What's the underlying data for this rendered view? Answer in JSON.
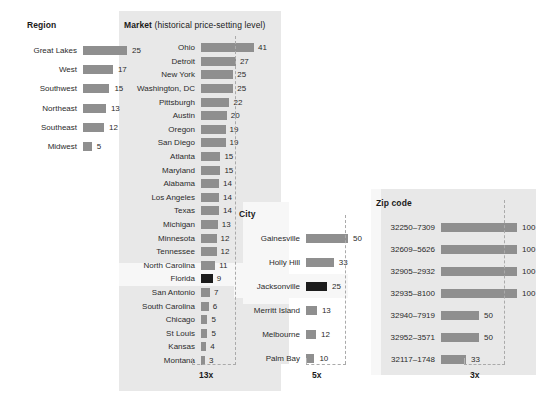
{
  "chart_data": {
    "type": "bar",
    "panels": [
      {
        "name": "region",
        "title": "Region",
        "title_sub": "",
        "max_value": 25,
        "categories": [
          "Great Lakes",
          "West",
          "Southwest",
          "Northeast",
          "Southeast",
          "Midwest"
        ],
        "values": [
          25,
          17,
          15,
          13,
          12,
          5
        ],
        "highlight": null,
        "multiplier": ""
      },
      {
        "name": "market",
        "title": "Market",
        "title_sub": " (historical price-setting level)",
        "max_value": 41,
        "categories": [
          "Ohio",
          "Detroit",
          "New York",
          "Washington, DC",
          "Pittsburgh",
          "Austin",
          "Oregon",
          "San Diego",
          "Atlanta",
          "Maryland",
          "Alabama",
          "Los Angeles",
          "Texas",
          "Michigan",
          "Minnesota",
          "Tennessee",
          "North Carolina",
          "Florida",
          "San Antonio",
          "South Carolina",
          "Chicago",
          "St Louis",
          "Kansas",
          "Montana"
        ],
        "values": [
          41,
          27,
          25,
          25,
          22,
          20,
          19,
          19,
          15,
          15,
          14,
          14,
          14,
          13,
          12,
          12,
          11,
          9,
          7,
          6,
          5,
          5,
          4,
          3
        ],
        "highlight": "Florida",
        "multiplier": "13x"
      },
      {
        "name": "city",
        "title": "City",
        "title_sub": "",
        "max_value": 50,
        "categories": [
          "Gainesville",
          "Holly Hill",
          "Jacksonville",
          "Merritt Island",
          "Melbourne",
          "Palm Bay"
        ],
        "values": [
          50,
          33,
          25,
          13,
          12,
          10
        ],
        "highlight": "Jacksonville",
        "multiplier": "5x"
      },
      {
        "name": "zip",
        "title": "Zip code",
        "title_sub": "",
        "max_value": 100,
        "categories": [
          "32250–7309",
          "32609–5626",
          "32905–2932",
          "32935–8100",
          "32940–7919",
          "32952–3571",
          "32117–1748"
        ],
        "values": [
          100,
          100,
          100,
          100,
          50,
          50,
          33
        ],
        "highlight": null,
        "multiplier": "3x"
      }
    ],
    "colors": {
      "bar": "#8f8f8f",
      "bar_highlight": "#1c1c1c",
      "panel_background": "#e8e8e8",
      "highlight_band": "#f7f7f7",
      "text": "#2b2b2b",
      "dash": "#aaaaaa"
    },
    "legend": [],
    "grid": false
  },
  "region": {
    "title": "Region",
    "title_sub": "",
    "rows": [
      {
        "label": "Great Lakes",
        "value": "25"
      },
      {
        "label": "West",
        "value": "17"
      },
      {
        "label": "Southwest",
        "value": "15"
      },
      {
        "label": "Northeast",
        "value": "13"
      },
      {
        "label": "Southeast",
        "value": "12"
      },
      {
        "label": "Midwest",
        "value": "5"
      }
    ]
  },
  "market": {
    "title": "Market",
    "title_sub": " (historical price-setting level)",
    "multiplier": "13x",
    "rows": [
      {
        "label": "Ohio",
        "value": "41"
      },
      {
        "label": "Detroit",
        "value": "27"
      },
      {
        "label": "New York",
        "value": "25"
      },
      {
        "label": "Washington, DC",
        "value": "25"
      },
      {
        "label": "Pittsburgh",
        "value": "22"
      },
      {
        "label": "Austin",
        "value": "20"
      },
      {
        "label": "Oregon",
        "value": "19"
      },
      {
        "label": "San Diego",
        "value": "19"
      },
      {
        "label": "Atlanta",
        "value": "15"
      },
      {
        "label": "Maryland",
        "value": "15"
      },
      {
        "label": "Alabama",
        "value": "14"
      },
      {
        "label": "Los Angeles",
        "value": "14"
      },
      {
        "label": "Texas",
        "value": "14"
      },
      {
        "label": "Michigan",
        "value": "13"
      },
      {
        "label": "Minnesota",
        "value": "12"
      },
      {
        "label": "Tennessee",
        "value": "12"
      },
      {
        "label": "North Carolina",
        "value": "11"
      },
      {
        "label": "Florida",
        "value": "9"
      },
      {
        "label": "San Antonio",
        "value": "7"
      },
      {
        "label": "South Carolina",
        "value": "6"
      },
      {
        "label": "Chicago",
        "value": "5"
      },
      {
        "label": "St Louis",
        "value": "5"
      },
      {
        "label": "Kansas",
        "value": "4"
      },
      {
        "label": "Montana",
        "value": "3"
      }
    ]
  },
  "city": {
    "title": "City",
    "title_sub": "",
    "multiplier": "5x",
    "rows": [
      {
        "label": "Gainesville",
        "value": "50"
      },
      {
        "label": "Holly Hill",
        "value": "33"
      },
      {
        "label": "Jacksonville",
        "value": "25"
      },
      {
        "label": "Merritt Island",
        "value": "13"
      },
      {
        "label": "Melbourne",
        "value": "12"
      },
      {
        "label": "Palm Bay",
        "value": "10"
      }
    ]
  },
  "zip": {
    "title": "Zip code",
    "title_sub": "",
    "multiplier": "3x",
    "rows": [
      {
        "label": "32250–7309",
        "value": "100"
      },
      {
        "label": "32609–5626",
        "value": "100"
      },
      {
        "label": "32905–2932",
        "value": "100"
      },
      {
        "label": "32935–8100",
        "value": "100"
      },
      {
        "label": "32940–7919",
        "value": "50"
      },
      {
        "label": "32952–3571",
        "value": "50"
      },
      {
        "label": "32117–1748",
        "value": "33"
      }
    ]
  }
}
